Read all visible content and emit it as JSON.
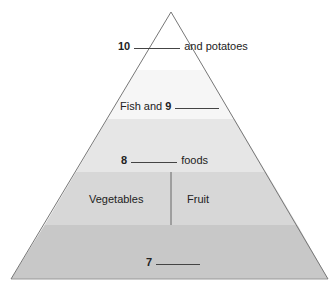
{
  "diagram": {
    "type": "food-pyramid",
    "levels": [
      {
        "id": "top",
        "number": "10",
        "text_after": "and potatoes",
        "fill": "#ffffff"
      },
      {
        "id": "fish",
        "text_before": "Fish and",
        "number": "9",
        "fill": "#f7f7f7"
      },
      {
        "id": "foods",
        "number": "8",
        "text_after": "foods",
        "fill": "#e6e6e6"
      },
      {
        "id": "veg-fruit",
        "left": "Vegetables",
        "right": "Fruit",
        "fill": "#d6d6d6"
      },
      {
        "id": "base",
        "number": "7",
        "fill": "#c6c6c6"
      }
    ],
    "outline_color": "#777777"
  }
}
